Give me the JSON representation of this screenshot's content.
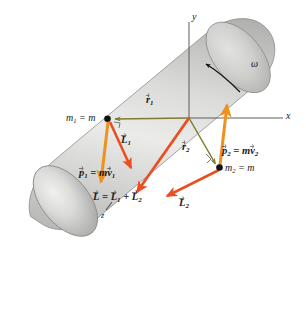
{
  "figure": {
    "background_color": "#ffffff",
    "body": {
      "shape": "cylinder",
      "name": "rotating-cylinder",
      "fill_light": "#f2f2f1",
      "fill_mid": "#c8c8c6",
      "fill_dark": "#9b9b99",
      "edge_color": "#8a8a88"
    },
    "axes": {
      "x_label": "x",
      "y_label": "y",
      "z_label": "z",
      "color": "#555553",
      "origin": {
        "x": 189,
        "y": 118
      }
    },
    "rotation": {
      "symbol": "ω",
      "direction": "counterclockwise",
      "arc_color": "#111111"
    },
    "particles": [
      {
        "name": "particle-1",
        "label_mass": "m",
        "label_mass_sub": "1",
        "label_eq": "= m",
        "x": 107,
        "y": 119
      },
      {
        "name": "particle-2",
        "label_mass": "m",
        "label_mass_sub": "2",
        "label_eq": "= m",
        "x": 219,
        "y": 168
      }
    ],
    "vectors": [
      {
        "name": "r1",
        "label_main": "r",
        "label_sub": "1",
        "color": "#7d7d2e",
        "kind": "position",
        "from": "origin",
        "to": "particle-1"
      },
      {
        "name": "r2",
        "label_main": "r",
        "label_sub": "2",
        "color": "#7d7d2e",
        "kind": "position",
        "from": "origin",
        "to": "particle-2"
      },
      {
        "name": "p1",
        "label_main": "p",
        "label_sub": "1",
        "label_rest": "= m",
        "label_rest2": "v",
        "label_rest2_sub": "1",
        "color": "#f0911e",
        "kind": "momentum",
        "direction": "down"
      },
      {
        "name": "p2",
        "label_main": "p",
        "label_sub": "2",
        "label_rest": "= m",
        "label_rest2": "v",
        "label_rest2_sub": "2",
        "color": "#f0911e",
        "kind": "momentum",
        "direction": "up"
      },
      {
        "name": "L1",
        "label_main": "L",
        "label_sub": "1",
        "color": "#ea4f21",
        "kind": "angular-momentum"
      },
      {
        "name": "L2",
        "label_main": "L",
        "label_sub": "2",
        "color": "#ea4f21",
        "kind": "angular-momentum"
      },
      {
        "name": "L-total",
        "label_main": "L",
        "label_eq": "=",
        "label_term1": "L",
        "label_term1_sub": "1",
        "label_plus": "+",
        "label_term2": "L",
        "label_term2_sub": "2",
        "color": "#ea4f21",
        "kind": "angular-momentum-total"
      }
    ]
  },
  "labels": {
    "x_axis": "x",
    "y_axis": "y",
    "z_axis": "z",
    "omega": "ω",
    "m1": "m",
    "m1_sub": "1",
    "m1_eq": "= m",
    "m2": "m",
    "m2_sub": "2",
    "m2_eq": "= m",
    "r1": "r",
    "r1_sub": "1",
    "r2": "r",
    "r2_sub": "2",
    "p1": "p",
    "p1_sub": "1",
    "p1_eq": "= m",
    "p1_v": "v",
    "p1_v_sub": "1",
    "p2": "p",
    "p2_sub": "2",
    "p2_eq": "= m",
    "p2_v": "v",
    "p2_v_sub": "2",
    "L1": "L",
    "L1_sub": "1",
    "L2": "L",
    "L2_sub": "2",
    "Ltot": "L",
    "Ltot_eq": "=",
    "Ltot_t1": "L",
    "Ltot_t1_sub": "1",
    "Ltot_plus": "+",
    "Ltot_t2": "L",
    "Ltot_t2_sub": "2"
  }
}
